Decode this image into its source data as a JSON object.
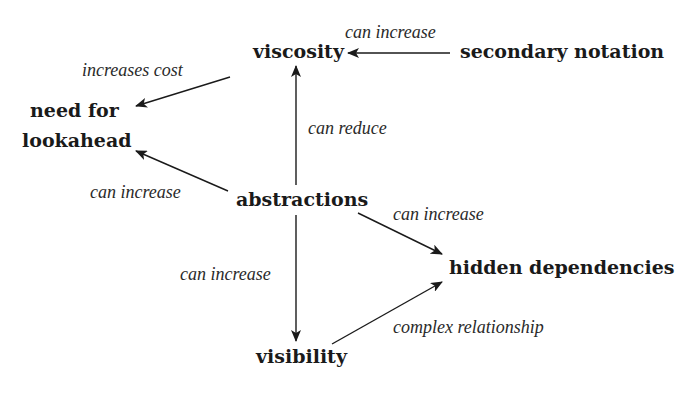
{
  "diagram": {
    "nodes": {
      "viscosity": "viscosity",
      "secondary_notation": "secondary notation",
      "need_for_lookahead_line1": "need for",
      "need_for_lookahead_line2": "lookahead",
      "abstractions": "abstractions",
      "hidden_dependencies": "hidden dependencies",
      "visibility": "visibility"
    },
    "edges": [
      {
        "from": "secondary notation",
        "to": "viscosity",
        "label": "can increase"
      },
      {
        "from": "viscosity",
        "to": "need for lookahead",
        "label": "increases cost"
      },
      {
        "from": "abstractions",
        "to": "viscosity",
        "label": "can reduce"
      },
      {
        "from": "abstractions",
        "to": "need for lookahead",
        "label": "can increase"
      },
      {
        "from": "abstractions",
        "to": "hidden dependencies",
        "label": "can increase"
      },
      {
        "from": "abstractions",
        "to": "visibility",
        "label": "can increase"
      },
      {
        "from": "visibility",
        "to": "hidden dependencies",
        "label": "complex relationship"
      }
    ],
    "colors": {
      "ink": "#1a1a1a",
      "background": "#ffffff"
    }
  }
}
